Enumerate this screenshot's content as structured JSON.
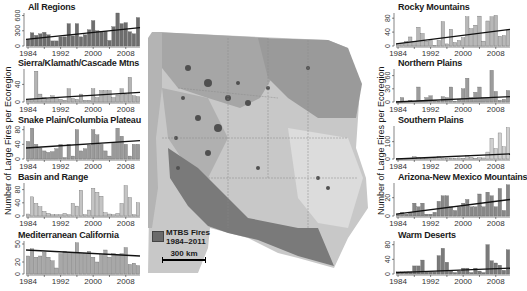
{
  "figure": {
    "y_axis_label": "Number of Large Fires per Ecoregion",
    "legend_label_line1": "MTBS Fires",
    "legend_label_line2": "1984–2011",
    "scale_bar_label": "300 km"
  },
  "chart_data": [
    {
      "type": "bar",
      "title": "All Regions",
      "x": [
        1984,
        1985,
        1986,
        1987,
        1988,
        1989,
        1990,
        1991,
        1992,
        1993,
        1994,
        1995,
        1996,
        1997,
        1998,
        1999,
        2000,
        2001,
        2002,
        2003,
        2004,
        2005,
        2006,
        2007,
        2008,
        2009,
        2010,
        2011
      ],
      "values": [
        130,
        260,
        210,
        240,
        270,
        220,
        100,
        100,
        180,
        180,
        440,
        200,
        440,
        180,
        220,
        320,
        500,
        300,
        290,
        290,
        110,
        380,
        650,
        440,
        460,
        280,
        240,
        560
      ],
      "yticks": [
        0,
        300,
        600
      ],
      "ylim": [
        0,
        650
      ],
      "xticks": [
        1984,
        1992,
        2000,
        2008
      ],
      "trend": [
        130,
        360
      ],
      "shade": "#6e6e6e",
      "position": "left-1"
    },
    {
      "type": "bar",
      "title": "Sierra/Klamath/Cascade Mtns",
      "x": [
        1984,
        1985,
        1986,
        1987,
        1988,
        1989,
        1990,
        1991,
        1992,
        1993,
        1994,
        1995,
        1996,
        1997,
        1998,
        1999,
        2000,
        2001,
        2002,
        2003,
        2004,
        2005,
        2006,
        2007,
        2008,
        2009,
        2010,
        2011
      ],
      "values": [
        4,
        6,
        70,
        18,
        10,
        6,
        14,
        8,
        6,
        4,
        30,
        8,
        6,
        18,
        4,
        4,
        30,
        10,
        26,
        26,
        26,
        10,
        16,
        30,
        18,
        56,
        14,
        12
      ],
      "yticks": [
        0,
        40
      ],
      "ylim": [
        0,
        75
      ],
      "xticks": [
        1984,
        1992,
        2000,
        2008
      ],
      "trend": [
        6,
        22
      ],
      "shade": "#b4b4b4",
      "position": "left-2"
    },
    {
      "type": "bar",
      "title": "Snake Plain/Columbia Plateau",
      "x": [
        1984,
        1985,
        1986,
        1987,
        1988,
        1989,
        1990,
        1991,
        1992,
        1993,
        1994,
        1995,
        1996,
        1997,
        1998,
        1999,
        2000,
        2001,
        2002,
        2003,
        2004,
        2005,
        2006,
        2007,
        2008,
        2009,
        2010,
        2011
      ],
      "values": [
        48,
        84,
        40,
        30,
        22,
        18,
        20,
        28,
        40,
        4,
        40,
        8,
        80,
        22,
        28,
        38,
        80,
        66,
        40,
        22,
        8,
        44,
        84,
        62,
        40,
        8,
        40,
        40
      ],
      "yticks": [
        0,
        40,
        80
      ],
      "ylim": [
        0,
        90
      ],
      "xticks": [
        1984,
        1992,
        2000,
        2008
      ],
      "trend": [
        30,
        50
      ],
      "shade": "#9a9a9a",
      "position": "left-3"
    },
    {
      "type": "bar",
      "title": "Basin and Range",
      "x": [
        1984,
        1985,
        1986,
        1987,
        1988,
        1989,
        1990,
        1991,
        1992,
        1993,
        1994,
        1995,
        1996,
        1997,
        1998,
        1999,
        2000,
        2001,
        2002,
        2003,
        2004,
        2005,
        2006,
        2007,
        2008,
        2009,
        2010,
        2011
      ],
      "values": [
        6,
        58,
        38,
        28,
        14,
        8,
        4,
        4,
        4,
        8,
        4,
        38,
        30,
        78,
        4,
        18,
        84,
        72,
        60,
        10,
        6,
        4,
        8,
        38,
        92,
        56,
        4,
        40
      ],
      "yticks": [
        0,
        40,
        80
      ],
      "ylim": [
        0,
        100
      ],
      "xticks": [
        1984,
        1992,
        2000,
        2008
      ],
      "trend": null,
      "shade": "#c4c4c4",
      "position": "left-4"
    },
    {
      "type": "bar",
      "title": "Mediterranean California",
      "x": [
        1984,
        1985,
        1986,
        1987,
        1988,
        1989,
        1990,
        1991,
        1992,
        1993,
        1994,
        1995,
        1996,
        1997,
        1998,
        1999,
        2000,
        2001,
        2002,
        2003,
        2004,
        2005,
        2006,
        2007,
        2008,
        2009,
        2010,
        2011
      ],
      "values": [
        30,
        42,
        28,
        30,
        36,
        28,
        22,
        10,
        34,
        38,
        36,
        36,
        52,
        34,
        34,
        38,
        28,
        20,
        32,
        40,
        28,
        34,
        32,
        34,
        44,
        16,
        18,
        14
      ],
      "yticks": [
        0,
        20,
        50
      ],
      "ylim": [
        0,
        55
      ],
      "xticks": [
        1984,
        1992,
        2000,
        2008
      ],
      "trend": [
        40,
        30
      ],
      "shade": "#a8a8a8",
      "position": "left-5"
    },
    {
      "type": "bar",
      "title": "Rocky Mountains",
      "x": [
        1984,
        1985,
        1986,
        1987,
        1988,
        1989,
        1990,
        1991,
        1992,
        1993,
        1994,
        1995,
        1996,
        1997,
        1998,
        1999,
        2000,
        2001,
        2002,
        2003,
        2004,
        2005,
        2006,
        2007,
        2008,
        2009,
        2010,
        2011
      ],
      "values": [
        4,
        8,
        14,
        26,
        12,
        54,
        36,
        14,
        16,
        2,
        16,
        70,
        6,
        48,
        10,
        16,
        24,
        84,
        50,
        60,
        86,
        14,
        72,
        84,
        88,
        28,
        30,
        46
      ],
      "yticks": [
        0,
        40,
        80
      ],
      "ylim": [
        0,
        95
      ],
      "xticks": [
        1984,
        1992,
        2000,
        2008
      ],
      "trend": [
        6,
        48
      ],
      "shade": "#b8b8b8",
      "position": "right-1"
    },
    {
      "type": "bar",
      "title": "Northern Plains",
      "x": [
        1984,
        1985,
        1986,
        1987,
        1988,
        1989,
        1990,
        1991,
        1992,
        1993,
        1994,
        1995,
        1996,
        1997,
        1998,
        1999,
        2000,
        2001,
        2002,
        2003,
        2004,
        2005,
        2006,
        2007,
        2008,
        2009,
        2010,
        2011
      ],
      "values": [
        2,
        10,
        2,
        4,
        2,
        34,
        4,
        10,
        14,
        4,
        2,
        12,
        10,
        34,
        2,
        6,
        30,
        54,
        10,
        22,
        34,
        10,
        10,
        72,
        24,
        4,
        6,
        26
      ],
      "yticks": [
        0,
        30,
        60
      ],
      "ylim": [
        0,
        75
      ],
      "xticks": [
        1984,
        1992,
        2000,
        2008
      ],
      "trend": [
        0,
        12
      ],
      "shade": "#9c9c9c",
      "position": "right-2"
    },
    {
      "type": "bar",
      "title": "Southern Plains",
      "x": [
        1984,
        1985,
        1986,
        1987,
        1988,
        1989,
        1990,
        1991,
        1992,
        1993,
        1994,
        1995,
        1996,
        1997,
        1998,
        1999,
        2000,
        2001,
        2002,
        2003,
        2004,
        2005,
        2006,
        2007,
        2008,
        2009,
        2010,
        2011
      ],
      "values": [
        2,
        2,
        4,
        4,
        14,
        10,
        4,
        4,
        6,
        4,
        16,
        6,
        4,
        4,
        4,
        6,
        4,
        20,
        10,
        4,
        8,
        6,
        40,
        120,
        60,
        150,
        70,
        180
      ],
      "yticks": [
        0,
        100
      ],
      "ylim": [
        0,
        190
      ],
      "xticks": [
        1984,
        1992,
        2000,
        2008
      ],
      "trend": [
        0,
        30
      ],
      "shade": "#d0d0d0",
      "position": "right-3"
    },
    {
      "type": "bar",
      "title": "Arizona-New Mexico Mountains",
      "x": [
        1984,
        1985,
        1986,
        1987,
        1988,
        1989,
        1990,
        1991,
        1992,
        1993,
        1994,
        1995,
        1996,
        1997,
        1998,
        1999,
        2000,
        2001,
        2002,
        2003,
        2004,
        2005,
        2006,
        2007,
        2008,
        2009,
        2010,
        2011
      ],
      "values": [
        2,
        4,
        2,
        4,
        14,
        10,
        14,
        2,
        2,
        4,
        16,
        22,
        22,
        10,
        6,
        10,
        14,
        18,
        10,
        10,
        24,
        10,
        26,
        22,
        10,
        30,
        6,
        34
      ],
      "yticks": [
        0,
        20
      ],
      "ylim": [
        0,
        36
      ],
      "xticks": [
        1984,
        1992,
        2000,
        2008
      ],
      "trend": [
        2,
        18
      ],
      "shade": "#888888",
      "position": "right-4"
    },
    {
      "type": "bar",
      "title": "Warm Deserts",
      "x": [
        1984,
        1985,
        1986,
        1987,
        1988,
        1989,
        1990,
        1991,
        1992,
        1993,
        1994,
        1995,
        1996,
        1997,
        1998,
        1999,
        2000,
        2001,
        2002,
        2003,
        2004,
        2005,
        2006,
        2007,
        2008,
        2009,
        2010,
        2011
      ],
      "values": [
        6,
        6,
        6,
        6,
        22,
        22,
        38,
        6,
        6,
        6,
        50,
        70,
        32,
        10,
        4,
        8,
        16,
        16,
        4,
        16,
        8,
        4,
        80,
        36,
        30,
        24,
        10,
        66
      ],
      "yticks": [
        0,
        40,
        80
      ],
      "ylim": [
        0,
        90
      ],
      "xticks": [
        1984,
        1992,
        2000,
        2008
      ],
      "trend": [
        4,
        16
      ],
      "shade": "#7a7a7a",
      "position": "right-5"
    }
  ]
}
